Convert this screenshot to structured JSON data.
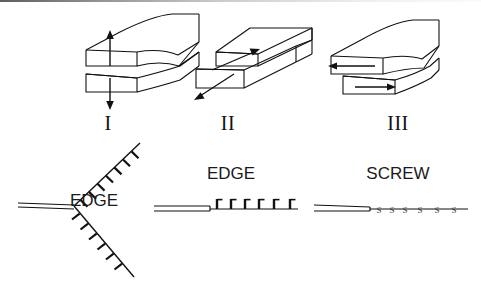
{
  "figure": {
    "background_color": "#ffffff",
    "line_color": "#111111",
    "top_rule_color": "#5d5d63"
  },
  "fracture_modes": {
    "caption_font": "serif",
    "items": [
      {
        "id": "mode-1",
        "label": "I",
        "name": "opening-mode",
        "arrow_directions": [
          "up",
          "down"
        ],
        "arrow_count": 2
      },
      {
        "id": "mode-2",
        "label": "II",
        "name": "in-plane-shear-mode",
        "arrow_directions": [
          "up-right",
          "down-left"
        ],
        "arrow_count": 2
      },
      {
        "id": "mode-3",
        "label": "III",
        "name": "anti-plane-shear-mode",
        "arrow_directions": [
          "left",
          "right"
        ],
        "arrow_count": 2
      }
    ]
  },
  "dislocations": {
    "items": [
      {
        "id": "dislocation-v",
        "label": "EDGE",
        "symbol": "perpendicular-tick",
        "geometry": "v-shaped",
        "tick_count_upper": 7,
        "tick_count_lower": 7,
        "has_double_line": true
      },
      {
        "id": "dislocation-edge",
        "label": "EDGE",
        "symbol": "perpendicular-tick",
        "geometry": "straight-horizontal",
        "tick_count": 6,
        "has_double_line": true
      },
      {
        "id": "dislocation-screw",
        "label": "SCREW",
        "symbol": "s-marker",
        "symbol_text": "S",
        "geometry": "straight-horizontal",
        "marker_count": 6,
        "has_double_line": true
      }
    ]
  },
  "icons": {
    "arrow_up": "arrow-up-icon",
    "arrow_down": "arrow-down-icon",
    "arrow_left": "arrow-left-icon",
    "arrow_right": "arrow-right-icon",
    "arrow_diagonal_up": "arrow-diagonal-up-icon",
    "arrow_diagonal_down": "arrow-diagonal-down-icon"
  }
}
